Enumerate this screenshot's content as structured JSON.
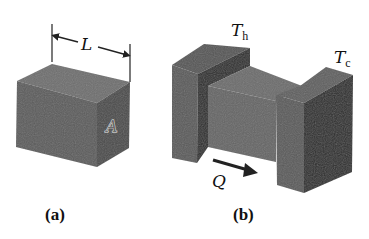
{
  "figure": {
    "panel_a": {
      "caption": "(a)",
      "length_label": "L",
      "area_label": "A"
    },
    "panel_b": {
      "caption": "(b)",
      "hot_label_main": "T",
      "hot_label_sub": "h",
      "cold_label_main": "T",
      "cold_label_sub": "c",
      "heat_flow_label": "Q"
    }
  }
}
